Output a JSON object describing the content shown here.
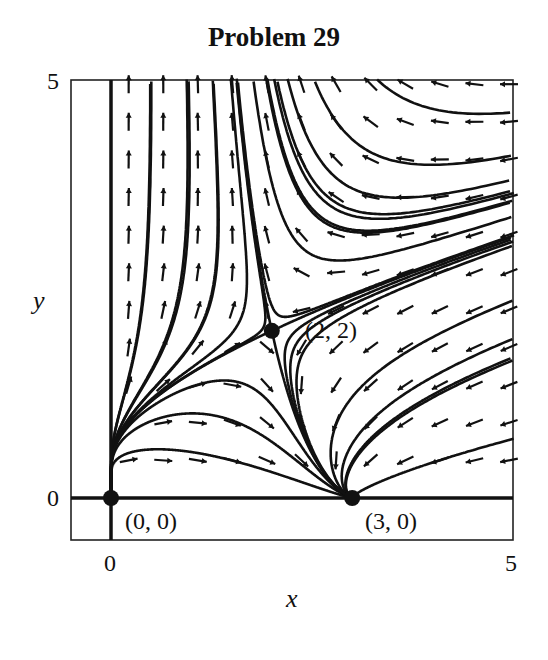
{
  "title": "Problem 29",
  "chart_data": {
    "type": "phase-portrait",
    "title": "Problem 29",
    "xlabel": "x",
    "ylabel": "y",
    "xlim": [
      0,
      5
    ],
    "ylim": [
      0,
      5
    ],
    "x_ticks": [
      "0",
      "5"
    ],
    "y_ticks": [
      "0",
      "5"
    ],
    "grid": false,
    "system_estimate": {
      "dxdt": "x(3 - x - y/2)",
      "dydt": "y(y - x)"
    },
    "equilibria": [
      {
        "label": "(0, 0)",
        "x": 0,
        "y": 0
      },
      {
        "label": "(3, 0)",
        "x": 3,
        "y": 0
      },
      {
        "label": "(2, 2)",
        "x": 2,
        "y": 2
      }
    ],
    "features": {
      "direction_field": true,
      "solution_curves": true,
      "invariant_axes": [
        "x = 0",
        "y = 0"
      ]
    }
  },
  "axes": {
    "x_tick_0": "0",
    "x_tick_5": "5",
    "y_tick_0": "0",
    "y_tick_5": "5",
    "xlabel": "x",
    "ylabel": "y"
  },
  "points": {
    "p00": "(0, 0)",
    "p30": "(3, 0)",
    "p22": "(2, 2)"
  },
  "style": {
    "ink": "#111111",
    "background": "#ffffff"
  }
}
